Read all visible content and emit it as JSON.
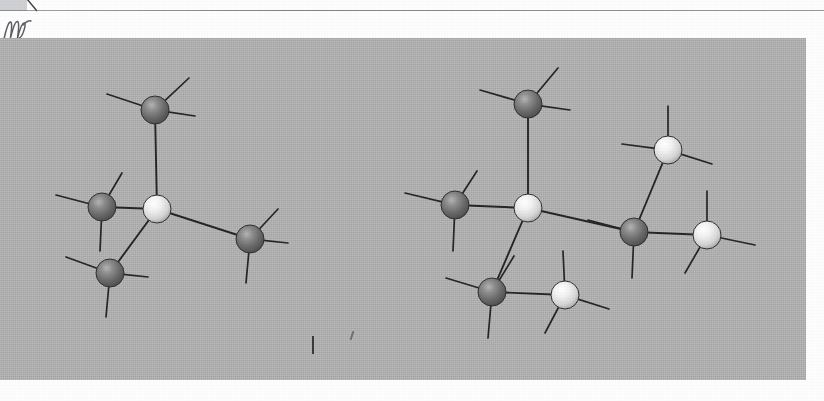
{
  "document": {
    "kind": "scanned-page",
    "page_background": "#fdfdfd",
    "top_rule_color": "#6e6e73",
    "margin_mark": "handwritten-scribble"
  },
  "figure": {
    "caption": "",
    "panel_background": "#b3b3b3",
    "panel": {
      "x": 0,
      "y": 38,
      "width": 806,
      "height": 342
    },
    "bond_color": "#262626",
    "atom_dark_color": "#6f6f6f",
    "atom_light_color": "#eeeeee",
    "atom_radius": 14,
    "structures": [
      {
        "name": "left-structure",
        "label": "",
        "atoms": [
          {
            "id": "L0",
            "type": "light",
            "cx": 157,
            "cy": 209
          },
          {
            "id": "L1",
            "type": "dark",
            "cx": 155,
            "cy": 110
          },
          {
            "id": "L2",
            "type": "dark",
            "cx": 102,
            "cy": 207
          },
          {
            "id": "L3",
            "type": "dark",
            "cx": 110,
            "cy": 273
          },
          {
            "id": "L4",
            "type": "dark",
            "cx": 250,
            "cy": 239
          }
        ],
        "bonds": [
          {
            "from": "L0",
            "to": "L1"
          },
          {
            "from": "L0",
            "to": "L2"
          },
          {
            "from": "L0",
            "to": "L3"
          },
          {
            "from": "L0",
            "to": "L4"
          }
        ],
        "stubs": [
          {
            "atom": "L1",
            "dx": -48,
            "dy": -16
          },
          {
            "atom": "L1",
            "dx": 34,
            "dy": -32
          },
          {
            "atom": "L1",
            "dx": 40,
            "dy": 6
          },
          {
            "atom": "L2",
            "dx": -46,
            "dy": -12
          },
          {
            "atom": "L2",
            "dx": 20,
            "dy": -34
          },
          {
            "atom": "L2",
            "dx": -2,
            "dy": 44
          },
          {
            "atom": "L3",
            "dx": -44,
            "dy": -16
          },
          {
            "atom": "L3",
            "dx": 38,
            "dy": 4
          },
          {
            "atom": "L3",
            "dx": -4,
            "dy": 44
          },
          {
            "atom": "L4",
            "dx": 28,
            "dy": -30
          },
          {
            "atom": "L4",
            "dx": 38,
            "dy": 4
          },
          {
            "atom": "L4",
            "dx": -4,
            "dy": 44
          }
        ]
      },
      {
        "name": "right-structure",
        "label": "",
        "atoms": [
          {
            "id": "R0",
            "type": "light",
            "cx": 528,
            "cy": 208
          },
          {
            "id": "R1",
            "type": "dark",
            "cx": 528,
            "cy": 104
          },
          {
            "id": "R2",
            "type": "dark",
            "cx": 455,
            "cy": 205
          },
          {
            "id": "R3",
            "type": "dark",
            "cx": 492,
            "cy": 292
          },
          {
            "id": "R4",
            "type": "light",
            "cx": 565,
            "cy": 295
          },
          {
            "id": "R5",
            "type": "dark",
            "cx": 634,
            "cy": 232
          },
          {
            "id": "R6",
            "type": "light",
            "cx": 668,
            "cy": 150
          },
          {
            "id": "R7",
            "type": "light",
            "cx": 707,
            "cy": 235
          }
        ],
        "bonds": [
          {
            "from": "R0",
            "to": "R1"
          },
          {
            "from": "R0",
            "to": "R2"
          },
          {
            "from": "R0",
            "to": "R3"
          },
          {
            "from": "R0",
            "to": "R5"
          },
          {
            "from": "R3",
            "to": "R4"
          },
          {
            "from": "R5",
            "to": "R6"
          },
          {
            "from": "R5",
            "to": "R7"
          }
        ],
        "stubs": [
          {
            "atom": "R1",
            "dx": -48,
            "dy": -14
          },
          {
            "atom": "R1",
            "dx": 30,
            "dy": -36
          },
          {
            "atom": "R1",
            "dx": 42,
            "dy": 6
          },
          {
            "atom": "R2",
            "dx": -50,
            "dy": -12
          },
          {
            "atom": "R2",
            "dx": 22,
            "dy": -34
          },
          {
            "atom": "R2",
            "dx": -2,
            "dy": 46
          },
          {
            "atom": "R3",
            "dx": -46,
            "dy": -14
          },
          {
            "atom": "R3",
            "dx": 22,
            "dy": -36
          },
          {
            "atom": "R3",
            "dx": -4,
            "dy": 46
          },
          {
            "atom": "R4",
            "dx": -2,
            "dy": -44
          },
          {
            "atom": "R4",
            "dx": 44,
            "dy": 14
          },
          {
            "atom": "R4",
            "dx": -20,
            "dy": 38
          },
          {
            "atom": "R5",
            "dx": -46,
            "dy": -12
          },
          {
            "atom": "R5",
            "dx": -2,
            "dy": 46
          },
          {
            "atom": "R6",
            "dx": -46,
            "dy": -6
          },
          {
            "atom": "R6",
            "dx": 0,
            "dy": -44
          },
          {
            "atom": "R6",
            "dx": 44,
            "dy": 14
          },
          {
            "atom": "R7",
            "dx": 0,
            "dy": -44
          },
          {
            "atom": "R7",
            "dx": 48,
            "dy": 10
          },
          {
            "atom": "R7",
            "dx": -22,
            "dy": 38
          }
        ]
      }
    ],
    "specks": [
      {
        "x": 312,
        "y": 336,
        "w": 2,
        "h": 18
      },
      {
        "x": 350,
        "y": 330,
        "w": 2,
        "h": 9
      }
    ]
  }
}
